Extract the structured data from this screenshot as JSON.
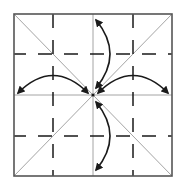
{
  "diagram": {
    "type": "origami-fold-diagram",
    "square": {
      "x": 14,
      "y": 14,
      "width": 158,
      "height": 162
    },
    "center": {
      "x": 93,
      "y": 95
    },
    "colors": {
      "background": "#ffffff",
      "border": "#555555",
      "crease": "#9a9a9a",
      "dash": "#1a1a1a",
      "arrow": "#1a1a1a"
    },
    "crease_lines": [
      {
        "name": "diagonal-tl-br",
        "x1": 14,
        "y1": 14,
        "x2": 172,
        "y2": 176
      },
      {
        "name": "diagonal-tr-bl",
        "x1": 172,
        "y1": 14,
        "x2": 14,
        "y2": 176
      },
      {
        "name": "center-vertical",
        "x1": 93,
        "y1": 14,
        "x2": 93,
        "y2": 176
      },
      {
        "name": "center-horizontal",
        "x1": 14,
        "y1": 95,
        "x2": 172,
        "y2": 95
      }
    ],
    "dashed_lines": [
      {
        "name": "dash-horizontal-upper",
        "orientation": "horizontal",
        "pos": 54
      },
      {
        "name": "dash-horizontal-lower",
        "orientation": "horizontal",
        "pos": 136
      },
      {
        "name": "dash-vertical-left",
        "orientation": "vertical",
        "pos": 53
      },
      {
        "name": "dash-vertical-right",
        "orientation": "vertical",
        "pos": 133
      }
    ],
    "arrows": [
      {
        "name": "arrow-top",
        "path": "M96,20 Q124,54 96,88"
      },
      {
        "name": "arrow-bottom",
        "path": "M96,102 Q124,136 96,170"
      },
      {
        "name": "arrow-left",
        "path": "M18,93 Q53,58 88,93"
      },
      {
        "name": "arrow-right",
        "path": "M98,93 Q133,58 168,93"
      }
    ]
  }
}
